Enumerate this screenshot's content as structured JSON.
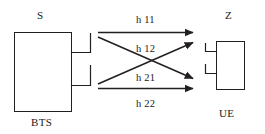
{
  "diagram": {
    "stroke_color": "#231f20",
    "background_color": "#ffffff",
    "transmitter": {
      "signal_label": "S",
      "device_label": "BTS",
      "antenna_count": 2
    },
    "receiver": {
      "signal_label": "Z",
      "device_label": "UE",
      "antenna_count": 2
    },
    "channels": [
      {
        "id": "h11",
        "label": "h 11",
        "from_antenna": 1,
        "to_antenna": 1
      },
      {
        "id": "h12",
        "label": "h 12",
        "from_antenna": 1,
        "to_antenna": 2
      },
      {
        "id": "h21",
        "label": "h 21",
        "from_antenna": 2,
        "to_antenna": 1
      },
      {
        "id": "h22",
        "label": "h 22",
        "from_antenna": 2,
        "to_antenna": 2
      }
    ]
  }
}
